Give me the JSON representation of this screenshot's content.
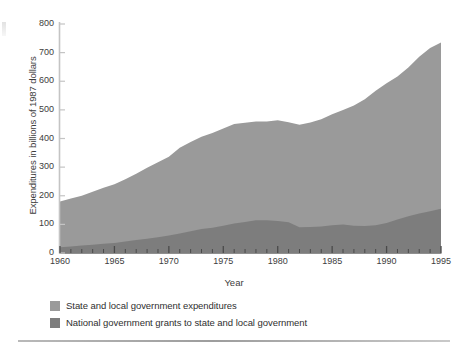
{
  "chart_data": {
    "type": "area",
    "stacked": true,
    "title": "",
    "subtitle": "",
    "xlabel": "Year",
    "ylabel": "Expenditures in billions of 1987 dollars",
    "xlim": [
      1960,
      1995
    ],
    "ylim": [
      0,
      800
    ],
    "grid": false,
    "legend_position": "below",
    "x_major_ticks": [
      1960,
      1965,
      1970,
      1975,
      1980,
      1985,
      1990,
      1995
    ],
    "x_tick_labels": [
      "1960",
      "1965",
      "1970",
      "1975",
      "1980",
      "1985",
      "1990",
      "1995"
    ],
    "x_minor_tick_interval": 1,
    "y_ticks": [
      0,
      100,
      200,
      300,
      400,
      500,
      600,
      700,
      800
    ],
    "y_tick_labels": [
      "0",
      "100",
      "200",
      "300",
      "400",
      "500",
      "600",
      "700",
      "800"
    ],
    "x": [
      1960,
      1961,
      1962,
      1963,
      1964,
      1965,
      1966,
      1967,
      1968,
      1969,
      1970,
      1971,
      1972,
      1973,
      1974,
      1975,
      1976,
      1977,
      1978,
      1979,
      1980,
      1981,
      1982,
      1983,
      1984,
      1985,
      1986,
      1987,
      1988,
      1989,
      1990,
      1991,
      1992,
      1993,
      1994,
      1995
    ],
    "series": [
      {
        "name": "National government grants to state and local government",
        "color": "#7d7d7d",
        "values": [
          20,
          23,
          26,
          29,
          32,
          35,
          40,
          45,
          50,
          55,
          61,
          68,
          76,
          84,
          88,
          95,
          103,
          108,
          114,
          114,
          112,
          107,
          90,
          91,
          93,
          97,
          100,
          95,
          94,
          97,
          105,
          117,
          128,
          138,
          146,
          155
        ]
      },
      {
        "name": "State and local government expenditures",
        "color": "#9a9a9a",
        "values": [
          160,
          167,
          174,
          185,
          196,
          205,
          218,
          232,
          248,
          262,
          275,
          300,
          312,
          322,
          331,
          340,
          348,
          347,
          345,
          345,
          352,
          350,
          358,
          365,
          374,
          388,
          400,
          420,
          443,
          470,
          488,
          500,
          520,
          548,
          570,
          580
        ]
      }
    ],
    "totals": [
      180,
      190,
      200,
      214,
      228,
      240,
      258,
      277,
      298,
      317,
      336,
      368,
      388,
      406,
      419,
      435,
      451,
      455,
      459,
      459,
      464,
      457,
      448,
      456,
      467,
      485,
      500,
      515,
      537,
      567,
      593,
      617,
      648,
      686,
      716,
      735
    ]
  },
  "legend": {
    "items": [
      {
        "label": "State and local government expenditures",
        "color": "#9a9a9a"
      },
      {
        "label": "National government grants to state and local government",
        "color": "#7d7d7d"
      }
    ]
  },
  "axes": {
    "y_title": "Expenditures in billions of 1987 dollars",
    "x_title": "Year"
  },
  "colors": {
    "series_light": "#9a9a9a",
    "series_dark": "#7d7d7d",
    "axis": "#bdbdbd",
    "text": "#3d3d3d",
    "rule": "#a8a8a8",
    "background": "#ffffff"
  }
}
